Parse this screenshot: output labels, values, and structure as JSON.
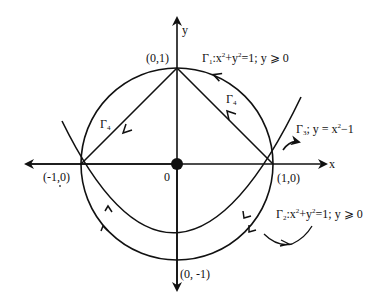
{
  "diagram": {
    "axes": {
      "x_label": "x",
      "y_label": "y",
      "origin_label": "0"
    },
    "points": {
      "top": "(0,1)",
      "right": "(1,0)",
      "left": "(-1,0)",
      "bottom": "(0, -1)"
    },
    "curves": {
      "gamma1": {
        "name": "Γ",
        "sub": "1",
        "eq": ":x",
        "eq2": "+y",
        "eq3": "=1; y ⩾ 0"
      },
      "gamma2": {
        "name": "Γ",
        "sub": "2",
        "eq": ":x",
        "eq2": "+y",
        "eq3": "=1; y ⩾ 0"
      },
      "gamma3": {
        "name": "Γ",
        "sub": "3",
        "eq": ";  y = x",
        "eq2": "−1"
      },
      "gamma4_left": {
        "name": "Γ",
        "sub": "4"
      },
      "gamma4_right": {
        "name": "Γ",
        "sub": "4"
      }
    },
    "sup2": "2"
  }
}
